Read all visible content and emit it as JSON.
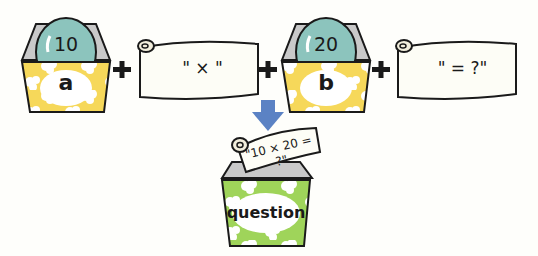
{
  "variables": [
    {
      "name": "a",
      "value": "10",
      "box_color": "#f6d85a"
    },
    {
      "name": "b",
      "value": "20",
      "box_color": "#f6d85a"
    }
  ],
  "strings": [
    {
      "text": "\" × \""
    },
    {
      "text": "\" = ?\""
    }
  ],
  "operators": [
    "+",
    "+",
    "+"
  ],
  "result": {
    "name": "question",
    "value": "\"10 × 20 = ?\"",
    "box_color": "#9fd45a"
  },
  "colors": {
    "ball": "#8cc4bd",
    "arrow": "#5b82c4",
    "outline": "#1a1a1a",
    "scroll_fill": "#fdfdf6"
  }
}
